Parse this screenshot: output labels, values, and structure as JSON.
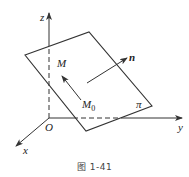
{
  "figure": {
    "caption": "图 1-41",
    "labels": {
      "z_axis": "z",
      "y_axis": "y",
      "x_axis": "x",
      "origin": "O",
      "normal": "n",
      "point_m": "M",
      "point_m0": "M",
      "point_m0_sub": "0",
      "plane": "π"
    },
    "colors": {
      "line": "#333333",
      "background": "#ffffff"
    }
  }
}
